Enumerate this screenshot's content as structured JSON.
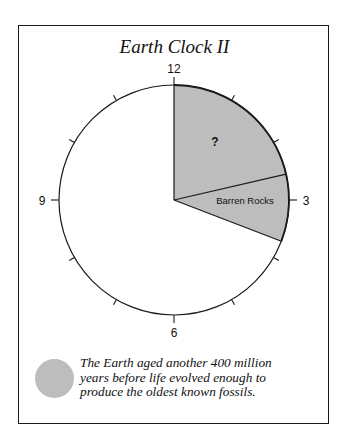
{
  "title": "Earth Clock II",
  "clock": {
    "center": [
      174,
      200
    ],
    "radius": 115,
    "hour_labels": [
      {
        "hour": 12,
        "label": "12"
      },
      {
        "hour": 3,
        "label": "3"
      },
      {
        "hour": 6,
        "label": "6"
      },
      {
        "hour": 9,
        "label": "9"
      }
    ],
    "minor_tick_hours": [
      1,
      2,
      4,
      5,
      7,
      8,
      10,
      11
    ],
    "wedges": [
      {
        "name": "unknown",
        "label": "?",
        "start_deg": 0,
        "end_deg": 77
      },
      {
        "name": "barren-rocks",
        "label": "Barren Rocks",
        "start_deg": 77,
        "end_deg": 111
      }
    ],
    "wedge_fill": "#bdbdbd",
    "line_color": "#1a1a1a"
  },
  "legend": {
    "swatch_color": "#bdbdbd",
    "lines": [
      "The Earth aged another 400 million",
      "years before life evolved enough to",
      "produce the oldest known fossils."
    ]
  }
}
